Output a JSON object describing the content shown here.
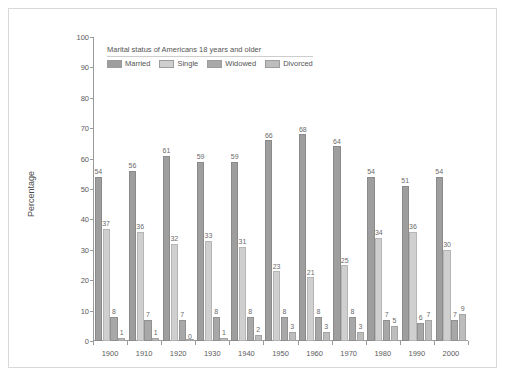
{
  "chart_data": {
    "type": "bar",
    "title": "Marital status of Americans 18 years and older",
    "xlabel": "",
    "ylabel": "Percentage",
    "ylim": [
      0,
      100
    ],
    "ytick_step": 10,
    "yticks": [
      0,
      10,
      20,
      30,
      40,
      50,
      60,
      70,
      80,
      90,
      100
    ],
    "grid": false,
    "legend_position": "top-left inside plot",
    "categories": [
      "1900",
      "1910",
      "1920",
      "1930",
      "1940",
      "1950",
      "1960",
      "1970",
      "1980",
      "1990",
      "2000"
    ],
    "series": [
      {
        "name": "Married",
        "color": "#9e9e9e",
        "values": [
          54,
          56,
          61,
          59,
          59,
          66,
          68,
          64,
          54,
          51,
          54
        ]
      },
      {
        "name": "Single",
        "color": "#cfcfcf",
        "values": [
          37,
          36,
          32,
          33,
          31,
          23,
          21,
          25,
          34,
          36,
          30
        ]
      },
      {
        "name": "Widowed",
        "color": "#a8a8a8",
        "values": [
          8,
          7,
          7,
          8,
          8,
          8,
          8,
          8,
          7,
          6,
          7
        ]
      },
      {
        "name": "Divorced",
        "color": "#bdbdbd",
        "values": [
          1,
          1,
          0,
          1,
          2,
          3,
          3,
          3,
          5,
          7,
          9
        ]
      }
    ]
  },
  "legend": {
    "title": "Marital status of Americans 18 years and older",
    "items": [
      "Married",
      "Single",
      "Widowed",
      "Divorced"
    ]
  },
  "axes": {
    "y_label": "Percentage",
    "y_ticks": [
      "100",
      "90",
      "80",
      "70",
      "60",
      "50",
      "40",
      "30",
      "20",
      "10",
      "0"
    ],
    "x_ticks": [
      "1900",
      "1910",
      "1920",
      "1930",
      "1940",
      "1950",
      "1960",
      "1970",
      "1980",
      "1990",
      "2000"
    ]
  }
}
